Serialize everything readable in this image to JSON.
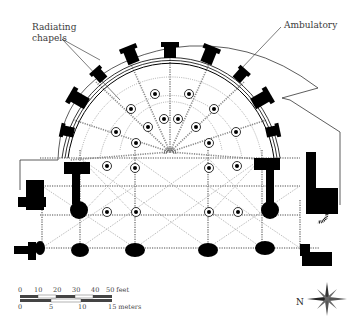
{
  "labels": {
    "radiating_line1": "Radiating",
    "radiating_line2": "chapels",
    "ambulatory": "Ambulatory"
  },
  "scale_bar": {
    "feet_ticks": [
      "0",
      "10",
      "20",
      "30",
      "40",
      "50 feet"
    ],
    "meter_ticks": [
      "0",
      "5",
      "10",
      "15 meters"
    ]
  },
  "compass": {
    "north_label": "N"
  },
  "colors": {
    "wall": "#000000",
    "rib_lines": "#777777",
    "outline": "#333333",
    "background": "#ffffff"
  }
}
